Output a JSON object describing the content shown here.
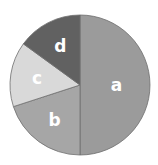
{
  "chart_data": {
    "type": "pie",
    "title": "",
    "categories": [
      "a",
      "b",
      "c",
      "d"
    ],
    "values": [
      50,
      20,
      15,
      15
    ],
    "colors": [
      "#9b9b9b",
      "#a6a6a6",
      "#d9d9d9",
      "#616161"
    ],
    "start_angle_deg": 0,
    "direction": "clockwise",
    "legend": "none",
    "labels_inside": true
  }
}
